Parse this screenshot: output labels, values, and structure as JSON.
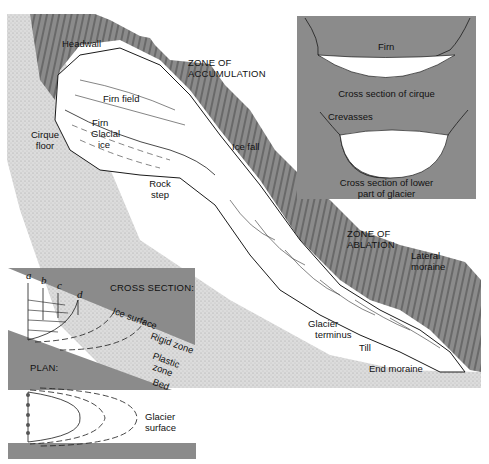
{
  "figure": {
    "type": "glacier-anatomy-diagram",
    "colors": {
      "rock_dark": "#8a8a8a",
      "stipple_ground": "#d9d9d9",
      "ice": "#ffffff",
      "line": "#1a1a1a",
      "background": "#ffffff"
    }
  },
  "main_diagram": {
    "labels": {
      "headwall": "Headwall",
      "zone_accumulation_1": "ZONE OF",
      "zone_accumulation_2": "ACCUMULATION",
      "firn_field": "Firn field",
      "firn": "Firn",
      "glacial_ice_1": "Glacial",
      "glacial_ice_2": "ice",
      "cirque_floor_1": "Cirque",
      "cirque_floor_2": "floor",
      "ice_fall": "Ice fall",
      "rock_step_1": "Rock",
      "rock_step_2": "step",
      "zone_ablation_1": "ZONE OF",
      "zone_ablation_2": "ABLATION",
      "lateral_moraine_1": "Lateral",
      "lateral_moraine_2": "moraine",
      "glacier_terminus_1": "Glacier",
      "glacier_terminus_2": "terminus",
      "till": "Till",
      "end_moraine": "End moraine"
    }
  },
  "inset_cross_sections": {
    "cirque": {
      "label": "Firn",
      "caption": "Cross section of cirque"
    },
    "lower_glacier": {
      "label": "Crevasses",
      "caption_1": "Cross section of lower",
      "caption_2": "part of glacier"
    }
  },
  "flow_diagram": {
    "cross_section": {
      "title": "CROSS SECTION:",
      "markers": [
        "a",
        "b",
        "c",
        "d"
      ],
      "ice_surface": "Ice surface",
      "rigid_zone": "Rigid zone",
      "plastic_zone_1": "Plastic",
      "plastic_zone_2": "zone",
      "bed": "Bed"
    },
    "plan": {
      "title": "PLAN:",
      "glacier_surface_1": "Glacier",
      "glacier_surface_2": "surface"
    }
  }
}
